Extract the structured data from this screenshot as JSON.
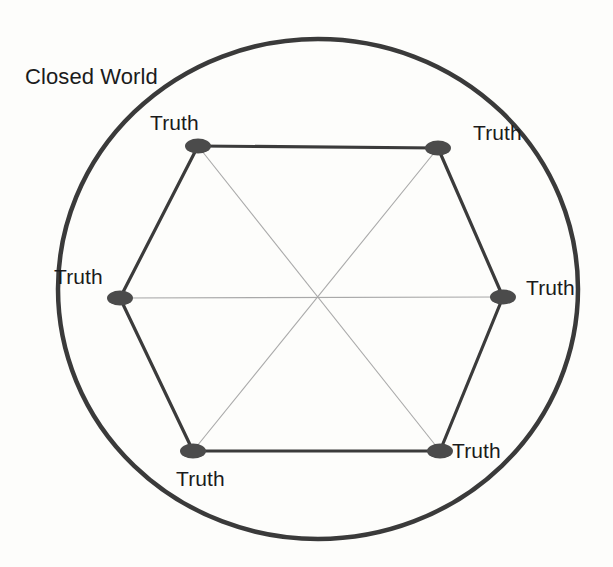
{
  "figure": {
    "title": "Closed World",
    "background_color": "#fdfdfb",
    "boundary": {
      "name": "Closed World",
      "label": "Closed World",
      "shape": "circle",
      "center_x": 318,
      "center_y": 289,
      "radius_x": 260,
      "radius_y": 250,
      "stroke_color": "#3a3a3a",
      "stroke_width": 4.5
    },
    "boundary_label": {
      "text": "Closed World",
      "x": 25,
      "y": 66
    },
    "polygon": {
      "shape": "hexagon",
      "sides": 6,
      "edge_color": "#3b3b3b",
      "edge_width": 3.2,
      "diagonal_color": "#a9a9a9",
      "diagonal_width": 1.1,
      "center_x": 320,
      "center_y": 298
    },
    "node_style": {
      "fill_color": "#4b4b4b",
      "radius_x": 13,
      "radius_y": 7.5
    },
    "nodes": [
      {
        "id": "truth-top-left",
        "label": "Truth",
        "cx": 198,
        "cy": 146,
        "label_x": 150,
        "label_y": 112
      },
      {
        "id": "truth-top-right",
        "label": "Truth",
        "cx": 438,
        "cy": 148,
        "label_x": 473,
        "label_y": 122
      },
      {
        "id": "truth-right",
        "label": "Truth",
        "cx": 503,
        "cy": 297,
        "label_x": 526,
        "label_y": 277
      },
      {
        "id": "truth-bottom-right",
        "label": "Truth",
        "cx": 440,
        "cy": 451,
        "label_x": 452,
        "label_y": 440
      },
      {
        "id": "truth-bottom-left",
        "label": "Truth",
        "cx": 193,
        "cy": 451,
        "label_x": 176,
        "label_y": 468
      },
      {
        "id": "truth-left",
        "label": "Truth",
        "cx": 120,
        "cy": 298,
        "label_x": 54,
        "label_y": 266
      }
    ],
    "edges": [
      {
        "from": "truth-top-left",
        "to": "truth-top-right"
      },
      {
        "from": "truth-top-right",
        "to": "truth-right"
      },
      {
        "from": "truth-right",
        "to": "truth-bottom-right"
      },
      {
        "from": "truth-bottom-right",
        "to": "truth-bottom-left"
      },
      {
        "from": "truth-bottom-left",
        "to": "truth-left"
      },
      {
        "from": "truth-left",
        "to": "truth-top-left"
      }
    ],
    "diagonals": [
      {
        "from": "truth-top-left",
        "to": "truth-bottom-right"
      },
      {
        "from": "truth-top-right",
        "to": "truth-bottom-left"
      },
      {
        "from": "truth-left",
        "to": "truth-right"
      }
    ]
  }
}
